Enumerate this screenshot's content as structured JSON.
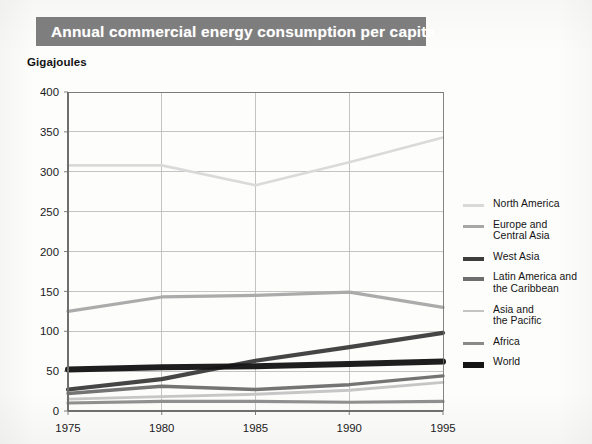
{
  "title": "Annual commercial energy consumption per capita",
  "y_unit_label": "Gigajoules",
  "legend": {
    "items": [
      {
        "label": "North America",
        "color": "#d9d9d9",
        "thickness": 2.6
      },
      {
        "label": "Europe and\nCentral Asia",
        "color": "#a8a8a8",
        "thickness": 3.2
      },
      {
        "label": "West Asia",
        "color": "#3d3d3d",
        "thickness": 4.2
      },
      {
        "label": "Latin America and\nthe Caribbean",
        "color": "#6e6e6e",
        "thickness": 3.4
      },
      {
        "label": "Asia and\nthe Pacific",
        "color": "#c4c4c4",
        "thickness": 2.8
      },
      {
        "label": "Africa",
        "color": "#8a8a8a",
        "thickness": 3.2
      },
      {
        "label": "World",
        "color": "#151515",
        "thickness": 6.0
      }
    ]
  },
  "chart_data": {
    "type": "line",
    "title": "Annual commercial energy consumption per capita",
    "xlabel": "",
    "ylabel": "Gigajoules",
    "x": [
      1975,
      1980,
      1985,
      1990,
      1995
    ],
    "xtick_labels": [
      "1975",
      "1980",
      "1985",
      "1990",
      "1995"
    ],
    "xlim": [
      1975,
      1995
    ],
    "ylim": [
      0,
      400
    ],
    "ytick_labels": [
      "0",
      "50",
      "100",
      "150",
      "200",
      "250",
      "300",
      "350",
      "400"
    ],
    "yticks": [
      0,
      50,
      100,
      150,
      200,
      250,
      300,
      350,
      400
    ],
    "grid": "horizontal-and-vertical",
    "legend_position": "right",
    "series": [
      {
        "name": "North America",
        "values": [
          308,
          308,
          283,
          312,
          343
        ],
        "color": "#d9d9d9",
        "thickness": 2.6
      },
      {
        "name": "Europe and Central Asia",
        "values": [
          125,
          143,
          145,
          149,
          130
        ],
        "color": "#a8a8a8",
        "thickness": 3.2
      },
      {
        "name": "West Asia",
        "values": [
          27,
          40,
          63,
          80,
          98
        ],
        "color": "#3d3d3d",
        "thickness": 4.2
      },
      {
        "name": "Latin America and the Caribbean",
        "values": [
          22,
          31,
          27,
          33,
          44
        ],
        "color": "#6e6e6e",
        "thickness": 3.4
      },
      {
        "name": "Asia and the Pacific",
        "values": [
          15,
          18,
          21,
          26,
          36
        ],
        "color": "#c4c4c4",
        "thickness": 2.8
      },
      {
        "name": "Africa",
        "values": [
          10,
          12,
          12,
          11,
          12
        ],
        "color": "#8a8a8a",
        "thickness": 3.2
      },
      {
        "name": "World",
        "values": [
          52,
          55,
          56,
          59,
          62
        ],
        "color": "#151515",
        "thickness": 6.0
      }
    ]
  },
  "colors": {
    "title_banner_bg": "#7e7e7e",
    "title_banner_text": "#ffffff",
    "axis": "#6f6f6f",
    "grid": "#b5b5b5",
    "tick_text": "#1a1a1a"
  }
}
